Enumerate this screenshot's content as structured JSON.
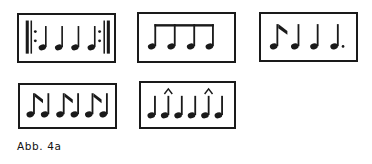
{
  "figure": {
    "caption": "Abb. 4a",
    "ink_color": "#1a1a1a",
    "background_color": "#ffffff",
    "box_count": 5
  },
  "boxes": [
    {
      "id": "box-1",
      "name": "repeated-quarter-notes-measure",
      "description": "Repeat-barline enclosed measure of four quarter notes",
      "symbols": [
        "repeat-start-barline",
        "quarter-note",
        "quarter-note",
        "quarter-note",
        "quarter-note",
        "repeat-end-barline"
      ],
      "note_count": 4,
      "note_value": "quarter"
    },
    {
      "id": "box-2",
      "name": "beamed-eighth-notes-measure",
      "description": "Four eighth notes joined by a single beam",
      "symbols": [
        "eighth-note",
        "eighth-note",
        "eighth-note",
        "eighth-note"
      ],
      "note_count": 4,
      "note_value": "eighth",
      "beamed": "true"
    },
    {
      "id": "box-3",
      "name": "eighth-and-quarter-notes-measure",
      "description": "Flagged eighth note followed by two quarter notes and a dotted quarter note",
      "symbols": [
        "eighth-note-flagged",
        "quarter-note",
        "quarter-note",
        "dotted-quarter-note"
      ],
      "note_count": 4,
      "note_value": "mixed"
    },
    {
      "id": "box-4",
      "name": "eighth-note-pairs-measure",
      "description": "Three pairs of notes, each a flagged eighth note followed by a plain note",
      "symbols": [
        "eighth-note-flagged",
        "quarter-note",
        "eighth-note-flagged",
        "quarter-note",
        "eighth-note-flagged",
        "quarter-note"
      ],
      "note_count": 6,
      "note_value": "eighth"
    },
    {
      "id": "box-5",
      "name": "accented-quarter-notes-measure",
      "description": "Six quarter notes with accent marks above the second and fifth notes",
      "symbols": [
        "quarter-note",
        "quarter-note-accented",
        "quarter-note",
        "quarter-note",
        "quarter-note-accented",
        "quarter-note"
      ],
      "note_count": 6,
      "note_value": "quarter",
      "accent_positions": [
        2,
        5
      ]
    }
  ]
}
